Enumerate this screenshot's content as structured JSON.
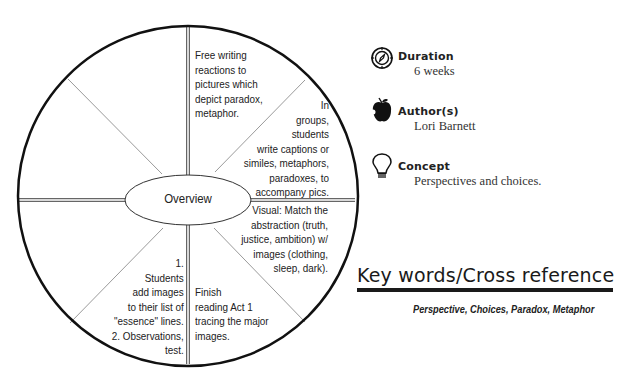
{
  "wheel": {
    "center_label": "Overview",
    "segments": [
      {
        "position": "top-right",
        "text": "Free writing\nreactions to\npictures which\ndepict paradox,\nmetaphor."
      },
      {
        "position": "upper-right",
        "text": "In\ngroups,\nstudents\nwrite captions or\nsimiles, metaphors,\nparadoxes, to\naccompany pics."
      },
      {
        "position": "lower-right",
        "text": "Visual: Match the\nabstraction (truth,\njustice, ambition) w/\nimages (clothing,\nsleep, dark)."
      },
      {
        "position": "bottom-right",
        "text": "Finish\nreading Act 1\ntracing the major\nimages."
      },
      {
        "position": "bottom-left",
        "text": "1.\nStudents\nadd images\nto their list of\n\"essence\" lines.\n2. Observations,\ntest."
      },
      {
        "position": "lower-left",
        "text": ""
      },
      {
        "position": "upper-left",
        "text": ""
      },
      {
        "position": "top-left",
        "text": ""
      }
    ]
  },
  "info": {
    "duration": {
      "icon": "compass-icon",
      "title": "Duration",
      "value": "6 weeks"
    },
    "authors": {
      "icon": "apple-icon",
      "title": "Author(s)",
      "value": "Lori Barnett"
    },
    "concept": {
      "icon": "lightbulb-icon",
      "title": "Concept",
      "value": "Perspectives and choices."
    }
  },
  "keywords": {
    "title": "Key words/Cross reference",
    "list": "Perspective, Choices, Paradox, Metaphor"
  }
}
